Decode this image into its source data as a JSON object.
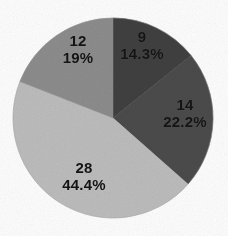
{
  "figure": {
    "background_color": "#fdfdfd",
    "label_text_color": "#141414"
  },
  "chart_data": {
    "type": "pie",
    "title": "",
    "subtitle": "",
    "xlabel": "",
    "ylabel": "",
    "total": 63,
    "legend": "none",
    "grid": false,
    "labels_inside_slices": true,
    "start_angle_deg": 0,
    "direction": "clockwise",
    "center": {
      "x": 113,
      "y": 118
    },
    "radius": 100,
    "categories": [
      "9",
      "14",
      "28",
      "12"
    ],
    "values": [
      9,
      14,
      28,
      12
    ],
    "percent_labels": [
      "14.3%",
      "22.2%",
      "44.4%",
      "19%"
    ],
    "percents": [
      14.3,
      22.2,
      44.4,
      19.0
    ],
    "colors": [
      "#3f3f3f",
      "#4c4c4c",
      "#bcbcbc",
      "#8c8c8c"
    ],
    "slices": [
      {
        "value_label": "9",
        "percent_label": "14.3%",
        "value": 9,
        "percent": 14.3,
        "color": "#3f3f3f",
        "start_deg": 0,
        "end_deg": 51.4
      },
      {
        "value_label": "14",
        "percent_label": "22.2%",
        "value": 14,
        "percent": 22.2,
        "color": "#4c4c4c",
        "start_deg": 51.4,
        "end_deg": 131.4
      },
      {
        "value_label": "28",
        "percent_label": "44.4%",
        "value": 28,
        "percent": 44.4,
        "color": "#bcbcbc",
        "start_deg": 131.4,
        "end_deg": 291.4
      },
      {
        "value_label": "12",
        "percent_label": "19%",
        "value": 12,
        "percent": 19.0,
        "color": "#8c8c8c",
        "start_deg": 291.4,
        "end_deg": 360
      }
    ]
  }
}
